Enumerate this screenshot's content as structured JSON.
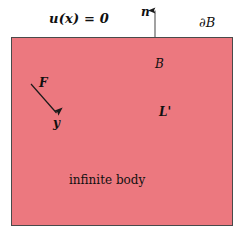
{
  "figure": {
    "canvas": {
      "width": 246,
      "height": 242,
      "background": "#ffffff"
    },
    "region": {
      "name": "infinite-body-region",
      "fill_color": "#ec787f",
      "border_color": "#4a4a4a",
      "x": 11,
      "y": 37,
      "width": 222,
      "height": 189
    },
    "labels": {
      "boundary_condition": "u(x) = 0",
      "normal_vector": "n",
      "boundary_symbol": "∂B",
      "body_symbol": "B",
      "line_symbol": "L'",
      "force_symbol": "F",
      "point_symbol": "y",
      "region_caption": "infinite body"
    },
    "arrows": [
      {
        "name": "normal-vector-arrow",
        "label": "n",
        "x1": 155,
        "y1": 37,
        "x2": 155,
        "y2": 9,
        "color": "#1a1a1a"
      },
      {
        "name": "force-arrow",
        "label": "F",
        "x1": 31,
        "y1": 84,
        "x2": 58,
        "y2": 115,
        "color": "#1a1a1a"
      }
    ]
  }
}
